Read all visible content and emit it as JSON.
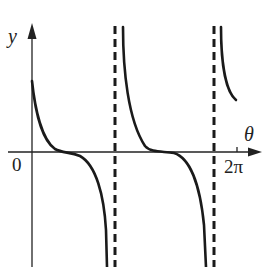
{
  "figure": {
    "type": "function-graph",
    "axes": {
      "x_label": "θ",
      "y_label": "y",
      "origin_label": "0",
      "x_tick_label": "2π"
    },
    "curve_description": "decreasing branches with inflection on θ-axis, separated by vertical dashed asymptotes",
    "asymptote_count": 2,
    "branch_count": 3,
    "colors": {
      "curve": "#1a1a1a",
      "axes": "#222222",
      "asymptote": "#1a1a1a",
      "background": "#ffffff"
    }
  }
}
